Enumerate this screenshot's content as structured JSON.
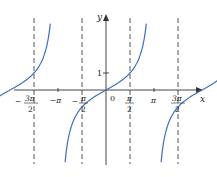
{
  "chart_data": {
    "type": "line",
    "title": "",
    "function": "y = tan x",
    "xlabel": "x",
    "ylabel": "y",
    "x_ticks": [
      "-3π/2",
      "-π",
      "-π/2",
      "0",
      "π/2",
      "π",
      "3π/2"
    ],
    "y_ticks": [
      "1"
    ],
    "asymptotes": [
      "-3π/2",
      "-π/2",
      "π/2",
      "3π/2"
    ],
    "series": [
      {
        "name": "tan x",
        "color": "#3a6fc4",
        "branches": [
          "(-3π/2, -π/2)",
          "(-π/2, π/2)",
          "(π/2, 3π/2)"
        ]
      }
    ],
    "grid": false,
    "legend": false
  },
  "labels": {
    "x_axis": "x",
    "y_axis": "y",
    "origin": "0",
    "one": "1"
  }
}
